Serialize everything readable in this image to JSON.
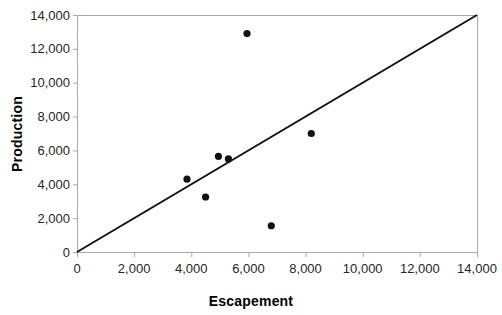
{
  "chart_data": {
    "type": "scatter",
    "title": "",
    "xlabel": "Escapement",
    "ylabel": "Production",
    "xlim": [
      0,
      14000
    ],
    "ylim": [
      0,
      14000
    ],
    "x_ticks": [
      0,
      2000,
      4000,
      6000,
      8000,
      10000,
      12000,
      14000
    ],
    "y_ticks": [
      0,
      2000,
      4000,
      6000,
      8000,
      10000,
      12000,
      14000
    ],
    "tick_format": "thousands-comma",
    "grid": false,
    "legend": "none",
    "points": [
      {
        "x": 3850,
        "y": 4300
      },
      {
        "x": 4500,
        "y": 3250
      },
      {
        "x": 4950,
        "y": 5650
      },
      {
        "x": 5300,
        "y": 5500
      },
      {
        "x": 5950,
        "y": 12900
      },
      {
        "x": 6800,
        "y": 1550
      },
      {
        "x": 8200,
        "y": 7000
      }
    ],
    "replacement_line": {
      "from": {
        "x": 0,
        "y": 0
      },
      "to": {
        "x": 14000,
        "y": 14000
      }
    },
    "colors": {
      "background": "#ffffff",
      "point": "#111111",
      "line": "#111111",
      "axis": "#a8a8a8",
      "tick_label": "#262626",
      "axis_title": "#000000"
    }
  }
}
